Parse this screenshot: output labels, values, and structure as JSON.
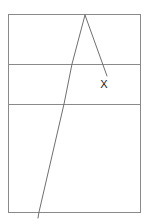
{
  "figure": {
    "title": "",
    "background_color": "#ffffff",
    "frame_color": "#8a8a8a",
    "line_color": "#6f6f6f",
    "label_color": "#1b1b1b",
    "labels": [
      {
        "text": "X",
        "x": 104,
        "y": 85
      }
    ]
  },
  "chart_data": {
    "type": "line",
    "title": "",
    "xlabel": "",
    "ylabel": "",
    "grid": true,
    "legend": "none",
    "xlim": [
      0,
      148
    ],
    "ylim": [
      0,
      224
    ],
    "frame": {
      "x": 8,
      "y": 14,
      "width": 132,
      "height": 198
    },
    "horizontal_gridlines": [
      64,
      104
    ],
    "series": [
      {
        "name": "long-diagonal",
        "points": [
          {
            "x": 85,
            "y": 15
          },
          {
            "x": 72,
            "y": 64
          },
          {
            "x": 64,
            "y": 104
          },
          {
            "x": 39,
            "y": 212
          },
          {
            "x": 38,
            "y": 218
          }
        ]
      },
      {
        "name": "short-diagonal",
        "points": [
          {
            "x": 85,
            "y": 15
          },
          {
            "x": 107,
            "y": 76
          }
        ]
      }
    ],
    "annotations": [
      {
        "text": "X",
        "x": 104,
        "y": 85
      }
    ]
  }
}
